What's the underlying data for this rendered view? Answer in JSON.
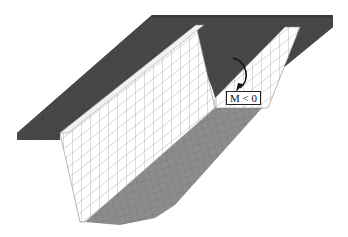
{
  "figure": {
    "annotation": {
      "label": "M < 0",
      "arrow": "curved-moment-arrow"
    },
    "colors": {
      "top_slab": "#474747",
      "top_slab_edge": "#3a3a3a",
      "web": "#ffffff",
      "mesh_line": "#8a8a8a",
      "bottom_flange": "#8c8c8c",
      "background": "#ffffff"
    }
  }
}
